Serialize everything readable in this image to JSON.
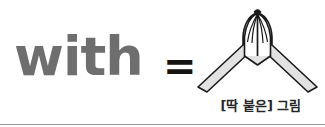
{
  "figure": {
    "width": 325,
    "height": 127,
    "background_color": "#ffffff"
  },
  "equation": {
    "left_term": "with",
    "left_term_color": "#6e6e6e",
    "operator": "=",
    "operator_color": "#141414"
  },
  "illustration": {
    "icon_name": "pressed-palms-hands-icon",
    "description": "two hands pressed together with forearms forming a V",
    "fill_color": "#e2e2e2",
    "outline_color": "#1a1a1a",
    "finger_count": 5
  },
  "caption": {
    "text": "[딱 붙은] 그림",
    "color": "#262626"
  },
  "divider": {
    "color": "#9a9a9a"
  }
}
